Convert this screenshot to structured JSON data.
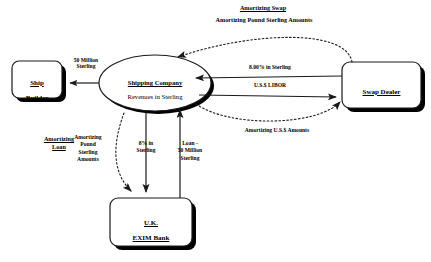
{
  "diagram": {
    "nodes": {
      "ship_builder": {
        "line1": "Ship",
        "line2": "Builder"
      },
      "shipping_company": {
        "line1": "Shipping Company",
        "line2": "Revenues in Sterling"
      },
      "swap_dealer": {
        "line1": "Swap Dealer"
      },
      "exim_bank": {
        "line1": "U.K.",
        "line2": "EXIM Bank"
      }
    },
    "sections": {
      "amortizing_swap_title": "Amortizing Swap",
      "amortizing_swap_subtitle": "Amortizing Pound Sterling Amounts",
      "amortizing_loan_title": "Amortizing\nLoan"
    },
    "edges": {
      "ship_payment": "50 Million\nSterling",
      "swap_fixed_leg": "8.00% in Sterling",
      "swap_floating_leg": "U.S.$ LIBOR",
      "amortizing_usd": "Amortizing U.S.$ Amounts",
      "amortizing_gbp_loan": "Amortizing\nPound\nSterling\nAmounts",
      "loan_interest": "8% in\nSterling",
      "loan_principal": "Loan -\n50 Million\nSterling"
    },
    "colors": {
      "stroke": "#1a1a1a",
      "shadow": "#000000",
      "fill": "#ffffff",
      "background": "#ffffff"
    }
  }
}
